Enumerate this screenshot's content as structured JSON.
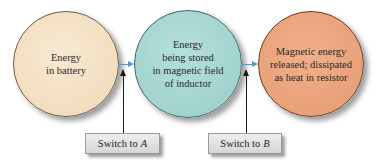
{
  "diagram": {
    "type": "energy-flow",
    "nodes": [
      {
        "id": "battery",
        "lines": [
          "Energy",
          "in battery"
        ],
        "color": "#f3dfc0"
      },
      {
        "id": "inductor",
        "lines": [
          "Energy",
          "being stored",
          "in magnetic field",
          "of inductor"
        ],
        "color": "#a8d8d4"
      },
      {
        "id": "resistor",
        "lines": [
          "Magnetic energy",
          "released; dissipated",
          "as heat in resistor"
        ],
        "color": "#eba47e"
      }
    ],
    "arrows": [
      {
        "from": "battery",
        "to": "inductor",
        "color": "#4a9fd0"
      },
      {
        "from": "inductor",
        "to": "resistor",
        "color": "#4a9fd0"
      }
    ],
    "switches": [
      {
        "prefix": "Switch to",
        "target": "A",
        "points_to_arrow": 0
      },
      {
        "prefix": "Switch to",
        "target": "B",
        "points_to_arrow": 1
      }
    ]
  }
}
